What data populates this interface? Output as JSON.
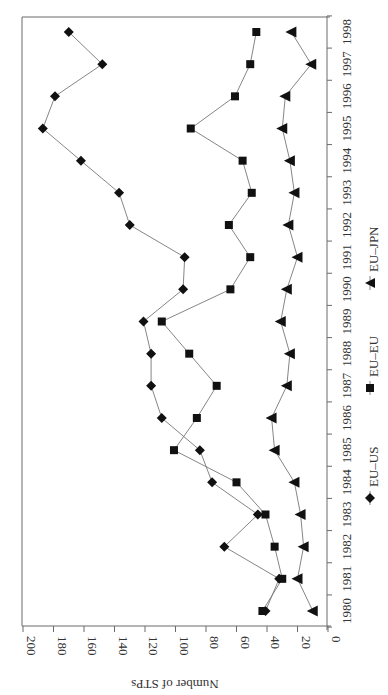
{
  "chart_data": {
    "type": "line",
    "title": "",
    "xlabel": "",
    "ylabel": "Number of STPs",
    "ylim": [
      0,
      200
    ],
    "yticks": [
      0,
      20,
      40,
      60,
      80,
      100,
      120,
      140,
      160,
      180,
      200
    ],
    "x": [
      1980,
      1981,
      1982,
      1983,
      1984,
      1985,
      1986,
      1987,
      1988,
      1989,
      1990,
      1991,
      1992,
      1993,
      1994,
      1995,
      1996,
      1997,
      1998
    ],
    "categories": [
      "1980",
      "1981",
      "1982",
      "1983",
      "1984",
      "1985",
      "1986",
      "1987",
      "1988",
      "1989",
      "1990",
      "1991",
      "1992",
      "1993",
      "1994",
      "1995",
      "1996",
      "1997",
      "1998"
    ],
    "series": [
      {
        "name": "EU–US",
        "marker": "diamond",
        "values": [
          41,
          32,
          68,
          46,
          76,
          84,
          109,
          116,
          116,
          121,
          95,
          94,
          130,
          137,
          162,
          187,
          179,
          148,
          170
        ]
      },
      {
        "name": "EU–EU",
        "marker": "square",
        "values": [
          43,
          30,
          35,
          41,
          60,
          101,
          86,
          73,
          91,
          109,
          64,
          51,
          65,
          50,
          56,
          90,
          61,
          51,
          47
        ]
      },
      {
        "name": "EU–JPN",
        "marker": "triangle",
        "values": [
          10,
          20,
          16,
          18,
          22,
          35,
          37,
          27,
          25,
          31,
          27,
          20,
          26,
          22,
          25,
          30,
          28,
          11,
          24
        ]
      }
    ],
    "legend_position": "right (rotated)",
    "grid": false,
    "orientation": "rotated 90 degrees clockwise"
  }
}
